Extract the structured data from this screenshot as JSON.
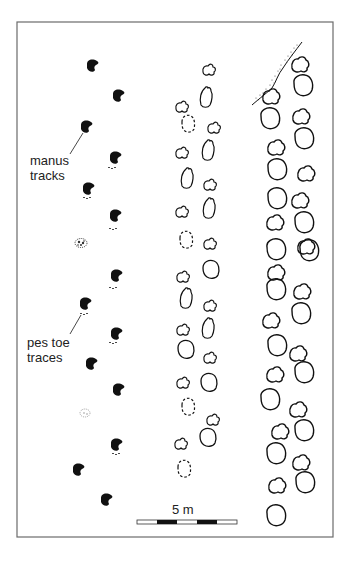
{
  "figure": {
    "frame": {
      "x": 17,
      "y": 22,
      "width": 316,
      "height": 515,
      "stroke": "#6b6b6b"
    },
    "labels": {
      "manus": {
        "line1": "manus",
        "line2": "tracks"
      },
      "pes": {
        "line1": "pes toe",
        "line2": "traces"
      }
    },
    "scale_bar": {
      "label": "5 m",
      "segments": 5,
      "x": 137,
      "y": 520,
      "width": 100
    },
    "colors": {
      "ink": "#111111",
      "frame": "#6b6b6b",
      "stipple": "#555555"
    }
  },
  "trackways": {
    "left": {
      "description": "manus-dominated trackway (solid black manus prints with pes toe traces)",
      "manus": [
        [
          93,
          66
        ],
        [
          119,
          96
        ],
        [
          87,
          127
        ],
        [
          116,
          158
        ],
        [
          89,
          189
        ],
        [
          116,
          216
        ],
        [
          117,
          276
        ],
        [
          86,
          304
        ],
        [
          117,
          334
        ],
        [
          92,
          364
        ],
        [
          119,
          390
        ],
        [
          117,
          445
        ],
        [
          79,
          470
        ],
        [
          107,
          500
        ]
      ],
      "stippled": [
        [
          81,
          243
        ],
        [
          85,
          413
        ]
      ],
      "toe_traces": [
        [
          112,
          168
        ],
        [
          87,
          198
        ],
        [
          113,
          229
        ],
        [
          113,
          288
        ],
        [
          84,
          314
        ],
        [
          113,
          343
        ],
        [
          116,
          454
        ]
      ]
    },
    "middle": {
      "description": "small tracks, some dashed (poorly preserved)",
      "prints": [
        [
          209,
          70,
          "m"
        ],
        [
          206,
          97,
          "p"
        ],
        [
          182,
          107,
          "m"
        ],
        [
          188,
          124,
          "d"
        ],
        [
          214,
          128,
          "m"
        ],
        [
          206,
          150,
          "p"
        ],
        [
          182,
          153,
          "m"
        ],
        [
          187,
          178,
          "p"
        ],
        [
          210,
          186,
          "m"
        ],
        [
          209,
          206,
          "p"
        ],
        [
          182,
          210,
          "m"
        ],
        [
          186,
          238,
          "d"
        ],
        [
          210,
          243,
          "m"
        ],
        [
          211,
          270,
          "p"
        ],
        [
          183,
          276,
          "m"
        ],
        [
          186,
          297,
          "p"
        ],
        [
          210,
          305,
          "m"
        ],
        [
          208,
          326,
          "p"
        ],
        [
          183,
          329,
          "m"
        ],
        [
          186,
          348,
          "o"
        ],
        [
          210,
          357,
          "m"
        ],
        [
          209,
          381,
          "p"
        ],
        [
          183,
          381,
          "m"
        ],
        [
          188,
          405,
          "d"
        ],
        [
          214,
          420,
          "m"
        ],
        [
          208,
          438,
          "p"
        ],
        [
          181,
          443,
          "m"
        ],
        [
          184,
          468,
          "d"
        ]
      ]
    },
    "right": {
      "description": "large tracks, tracks cut by stippled margin at top",
      "prints": [
        [
          301,
          64,
          "m"
        ],
        [
          303,
          86,
          "o"
        ],
        [
          272,
          96,
          "m"
        ],
        [
          270,
          118,
          "o"
        ],
        [
          302,
          116,
          "m"
        ],
        [
          303,
          140,
          "o"
        ],
        [
          275,
          146,
          "m"
        ],
        [
          278,
          168,
          "o"
        ],
        [
          306,
          172,
          "m"
        ],
        [
          278,
          198,
          "o"
        ],
        [
          300,
          198,
          "m"
        ],
        [
          274,
          221,
          "m"
        ],
        [
          303,
          223,
          "o"
        ],
        [
          275,
          247,
          "o"
        ],
        [
          306,
          245,
          "m"
        ],
        [
          276,
          270,
          "m"
        ],
        [
          309,
          249,
          "o"
        ],
        [
          275,
          286,
          "o"
        ],
        [
          302,
          290,
          "m"
        ],
        [
          270,
          318,
          "m"
        ],
        [
          300,
          313,
          "o"
        ],
        [
          277,
          346,
          "o"
        ],
        [
          298,
          356,
          "m"
        ],
        [
          274,
          376,
          "m"
        ],
        [
          303,
          372,
          "o"
        ],
        [
          270,
          397,
          "o"
        ],
        [
          297,
          408,
          "m"
        ],
        [
          279,
          431,
          "m"
        ],
        [
          304,
          429,
          "o"
        ],
        [
          277,
          452,
          "o"
        ],
        [
          301,
          462,
          "m"
        ],
        [
          276,
          483,
          "m"
        ],
        [
          305,
          483,
          "o"
        ],
        [
          277,
          516,
          "o"
        ]
      ]
    }
  }
}
